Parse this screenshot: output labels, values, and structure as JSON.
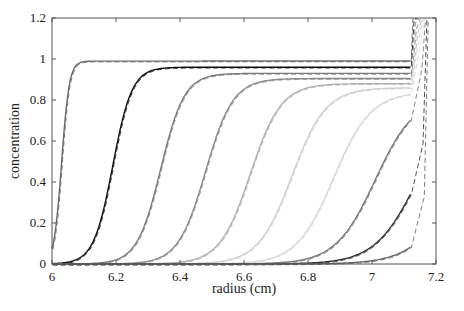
{
  "chart_data": {
    "type": "line",
    "title": "",
    "xlabel": "radius (cm)",
    "ylabel": "concentration",
    "xlim": [
      6,
      7.2
    ],
    "ylim": [
      0,
      1.2
    ],
    "xticks": [
      6,
      6.2,
      6.4,
      6.6,
      6.8,
      7,
      7.2
    ],
    "xtick_labels": [
      "6",
      "6.2",
      "6.4",
      "6.6",
      "6.8",
      "7",
      "7.2"
    ],
    "yticks": [
      0,
      0.2,
      0.4,
      0.6,
      0.8,
      1,
      1.2
    ],
    "ytick_labels": [
      "0",
      "0.2",
      "0.4",
      "0.6",
      "0.8",
      "1",
      "1.2"
    ],
    "grid": false,
    "legend": null,
    "meniscus": 6.0,
    "cell_bottom": 7.12,
    "series": [
      {
        "name": "scan 1",
        "midpoint": 6.03,
        "width": 0.012,
        "plateau": 0.99,
        "color": "#6a6a6a"
      },
      {
        "name": "scan 2",
        "midpoint": 6.19,
        "width": 0.03,
        "plateau": 0.96,
        "color": "#111111"
      },
      {
        "name": "scan 3",
        "midpoint": 6.34,
        "width": 0.037,
        "plateau": 0.93,
        "color": "#7a7a7a"
      },
      {
        "name": "scan 4",
        "midpoint": 6.48,
        "width": 0.043,
        "plateau": 0.905,
        "color": "#8a8a8a"
      },
      {
        "name": "scan 5",
        "midpoint": 6.62,
        "width": 0.048,
        "plateau": 0.88,
        "color": "#b0b0b0"
      },
      {
        "name": "scan 6",
        "midpoint": 6.75,
        "width": 0.053,
        "plateau": 0.86,
        "color": "#cfcfcf"
      },
      {
        "name": "scan 7",
        "midpoint": 6.88,
        "width": 0.058,
        "plateau": 0.84,
        "color": "#d8d8d8"
      },
      {
        "name": "scan 8",
        "midpoint": 7.01,
        "width": 0.062,
        "plateau": 0.82,
        "color": "#777777"
      },
      {
        "name": "scan 9",
        "midpoint": 7.14,
        "width": 0.066,
        "plateau": 0.8,
        "color": "#333333"
      },
      {
        "name": "scan 10",
        "midpoint": 7.27,
        "width": 0.07,
        "plateau": 0.78,
        "color": "#666666"
      }
    ],
    "end_values_at_7_1": [
      0.99,
      0.96,
      0.93,
      0.91,
      0.88,
      0.85,
      0.78,
      0.6,
      0.37,
      0.18
    ]
  },
  "axes": {
    "xlabel": "radius (cm)",
    "ylabel": "concentration"
  }
}
